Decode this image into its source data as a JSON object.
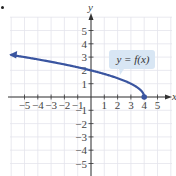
{
  "chart_data": {
    "type": "line",
    "title": "",
    "xlabel": "x",
    "ylabel": "y",
    "xlim": [
      -6,
      6
    ],
    "ylim": [
      -6,
      6
    ],
    "grid": true,
    "x_ticks": [
      -5,
      -4,
      -3,
      -2,
      -1,
      1,
      2,
      3,
      4,
      5
    ],
    "y_ticks": [
      -5,
      -4,
      -3,
      -2,
      -1,
      1,
      2,
      3,
      4,
      5
    ],
    "x_tick_labels": [
      "−5",
      "−4",
      "−3",
      "−2",
      "−1",
      "1",
      "2",
      "3",
      "4",
      "5"
    ],
    "y_tick_labels": [
      "−5",
      "−4",
      "−3",
      "−2",
      "−1",
      "1",
      "2",
      "3",
      "4",
      "5"
    ],
    "series": [
      {
        "name": "y = f(x)",
        "function": "sqrt(4 - x)",
        "x": [
          -6,
          -5,
          -4,
          -3,
          -2,
          -1,
          0,
          1,
          2,
          3,
          3.75,
          4
        ],
        "y": [
          3.16,
          3,
          2.83,
          2.65,
          2.45,
          2.24,
          2,
          1.73,
          1.41,
          1,
          0.5,
          0
        ],
        "color": "#3a55a0",
        "endpoint": {
          "x": 4,
          "y": 0,
          "style": "closed-dot"
        },
        "arrow": "left"
      }
    ],
    "annotations": [
      {
        "text": "y = f(x)",
        "x": 2.1,
        "y": 3,
        "style": "callout-box"
      }
    ]
  },
  "labels": {
    "x_axis": "x",
    "y_axis": "y",
    "callout": "y = f(x)"
  },
  "colors": {
    "curve": "#3a55a0",
    "grid": "#e4e4ec",
    "axis": "#333333",
    "callout_bg": "#d8e6f4"
  }
}
